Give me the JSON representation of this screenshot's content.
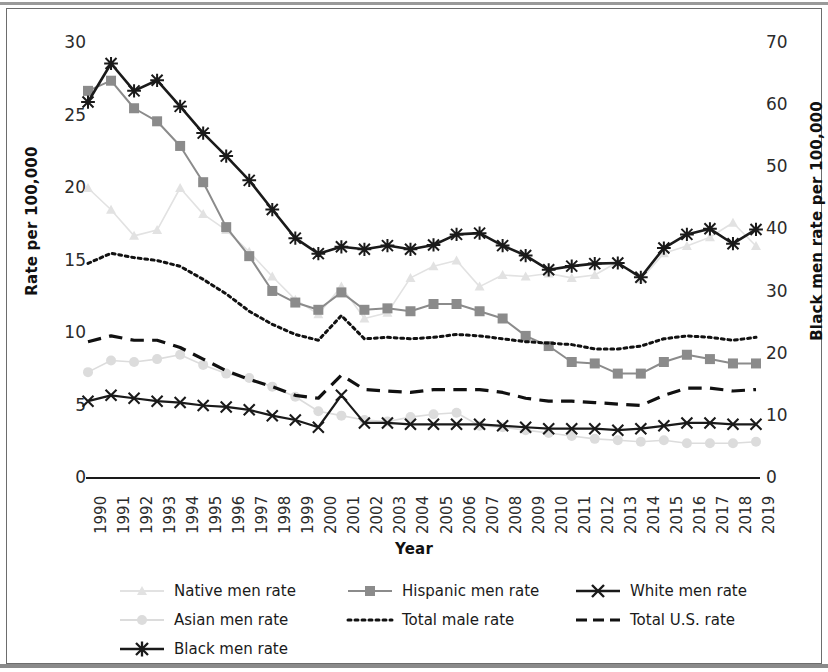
{
  "chart_data": {
    "type": "line",
    "title": "",
    "xlabel": "Year",
    "ylabel": "Rate per 100,000",
    "ylabel_right": "Black men rate per 100,000",
    "grid": false,
    "legend_position": "bottom",
    "ylim": [
      0,
      30
    ],
    "ylim_right": [
      0,
      70
    ],
    "yticks": [
      0,
      5,
      10,
      15,
      20,
      25,
      30
    ],
    "yticks_right": [
      0,
      10,
      20,
      30,
      40,
      50,
      60,
      70
    ],
    "x": [
      1990,
      1991,
      1992,
      1993,
      1994,
      1995,
      1996,
      1997,
      1998,
      1999,
      2000,
      2001,
      2002,
      2003,
      2004,
      2005,
      2006,
      2007,
      2008,
      2009,
      2010,
      2011,
      2012,
      2013,
      2014,
      2015,
      2016,
      2017,
      2018,
      2019
    ],
    "categories": [
      "1990",
      "1991",
      "1992",
      "1993",
      "1994",
      "1995",
      "1996",
      "1997",
      "1998",
      "1999",
      "2000",
      "2001",
      "2002",
      "2003",
      "2004",
      "2005",
      "2006",
      "2007",
      "2008",
      "2009",
      "2010",
      "2011",
      "2012",
      "2013",
      "2014",
      "2015",
      "2016",
      "2017",
      "2018",
      "2019"
    ],
    "series": [
      {
        "name": "Native men rate",
        "axis": "left",
        "color": "#e2e2e2",
        "marker": "triangle",
        "dash": "none",
        "width": 1.6,
        "values": [
          20.0,
          18.5,
          16.7,
          17.1,
          20.0,
          18.2,
          17.1,
          15.6,
          13.9,
          12.3,
          11.3,
          13.2,
          11.0,
          11.4,
          13.8,
          14.6,
          15.0,
          13.2,
          14.0,
          13.9,
          14.1,
          13.8,
          14.0,
          14.9,
          13.7,
          15.5,
          16.0,
          16.6,
          17.6,
          16.0
        ]
      },
      {
        "name": "Asian men rate",
        "axis": "left",
        "color": "#dcdcdc",
        "marker": "circle",
        "dash": "none",
        "width": 1.6,
        "values": [
          7.3,
          8.1,
          8.0,
          8.2,
          8.5,
          7.8,
          7.2,
          6.9,
          6.3,
          5.6,
          4.6,
          4.3,
          4.0,
          3.9,
          4.2,
          4.4,
          4.5,
          3.6,
          3.5,
          3.3,
          3.1,
          2.9,
          2.7,
          2.6,
          2.5,
          2.6,
          2.4,
          2.4,
          2.4,
          2.5
        ]
      },
      {
        "name": "Black men rate",
        "axis": "right",
        "color": "#1a1a1a",
        "marker": "asterisk",
        "dash": "none",
        "width": 2.6,
        "values": [
          60.5,
          66.7,
          62.3,
          64.0,
          59.8,
          55.5,
          51.8,
          47.9,
          43.2,
          38.6,
          36.1,
          37.2,
          36.8,
          37.4,
          36.8,
          37.5,
          39.2,
          39.4,
          37.4,
          35.8,
          33.5,
          34.1,
          34.5,
          34.6,
          32.3,
          37.0,
          39.2,
          40.1,
          37.7,
          40.0
        ]
      },
      {
        "name": "Hispanic men rate",
        "axis": "left",
        "color": "#8b8b8b",
        "marker": "square",
        "dash": "none",
        "width": 2.0,
        "values": [
          26.7,
          27.4,
          25.5,
          24.6,
          22.9,
          20.4,
          17.3,
          15.3,
          12.9,
          12.1,
          11.6,
          12.8,
          11.6,
          11.7,
          11.5,
          12.0,
          12.0,
          11.5,
          11.0,
          9.8,
          9.1,
          8.0,
          7.9,
          7.2,
          7.2,
          8.0,
          8.5,
          8.2,
          7.9,
          7.9
        ]
      },
      {
        "name": "Total male rate",
        "axis": "left",
        "color": "#111111",
        "marker": "none",
        "dash": "dotted",
        "width": 3.0,
        "values": [
          14.8,
          15.5,
          15.2,
          15.0,
          14.6,
          13.7,
          12.7,
          11.5,
          10.6,
          9.9,
          9.5,
          11.2,
          9.6,
          9.7,
          9.6,
          9.7,
          9.9,
          9.8,
          9.6,
          9.4,
          9.3,
          9.2,
          8.9,
          8.9,
          9.1,
          9.6,
          9.8,
          9.7,
          9.5,
          9.7
        ]
      },
      {
        "name": "White men rate",
        "axis": "left",
        "color": "#1a1a1a",
        "marker": "x",
        "dash": "none",
        "width": 2.2,
        "values": [
          5.3,
          5.7,
          5.5,
          5.3,
          5.2,
          5.0,
          4.9,
          4.7,
          4.3,
          4.0,
          3.5,
          5.7,
          3.8,
          3.8,
          3.7,
          3.7,
          3.7,
          3.7,
          3.6,
          3.5,
          3.4,
          3.4,
          3.4,
          3.3,
          3.4,
          3.6,
          3.8,
          3.8,
          3.7,
          3.7
        ]
      },
      {
        "name": "Total U.S. rate",
        "axis": "left",
        "color": "#111111",
        "marker": "none",
        "dash": "dashed",
        "width": 3.2,
        "values": [
          9.4,
          9.8,
          9.5,
          9.5,
          9.0,
          8.2,
          7.4,
          6.8,
          6.3,
          5.7,
          5.5,
          7.1,
          6.1,
          6.0,
          5.9,
          6.1,
          6.1,
          6.1,
          5.9,
          5.5,
          5.3,
          5.3,
          5.2,
          5.1,
          5.0,
          5.7,
          6.2,
          6.2,
          6.0,
          6.1
        ]
      }
    ],
    "legend": [
      {
        "label": "Native men rate",
        "style": "light-triangle"
      },
      {
        "label": "Asian men rate",
        "style": "light-circle"
      },
      {
        "label": "Black men rate",
        "style": "dark-asterisk"
      },
      {
        "label": "Hispanic men rate",
        "style": "gray-square"
      },
      {
        "label": "Total male rate",
        "style": "dotted"
      },
      {
        "label": "White men rate",
        "style": "dark-x"
      },
      {
        "label": "Total U.S. rate",
        "style": "dashed"
      }
    ]
  }
}
